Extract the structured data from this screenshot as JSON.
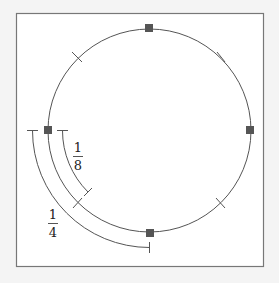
{
  "figure": {
    "frame_color": "#777777",
    "background_color": "#f4f4f4",
    "panel_color": "#ffffff",
    "line_color": "#555555",
    "marker_color": "#555555",
    "circle": {
      "quarter_markers": [
        "top",
        "right",
        "bottom",
        "left"
      ],
      "marker_shape": "filled-square",
      "eighth_ticks": [
        "upper-left",
        "upper-right",
        "lower-left",
        "lower-right"
      ]
    },
    "arcs": [
      {
        "id": "inner",
        "label_num": "1",
        "label_den": "8",
        "fraction": "1/8",
        "from": "left",
        "to": "lower-left"
      },
      {
        "id": "outer",
        "label_num": "1",
        "label_den": "4",
        "fraction": "1/4",
        "from": "left",
        "to": "bottom"
      }
    ]
  }
}
